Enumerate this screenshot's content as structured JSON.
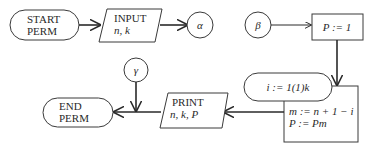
{
  "diagram": {
    "nodes": {
      "start": {
        "line1": "START",
        "line2": "PERM",
        "shape": "terminal"
      },
      "input": {
        "line1": "INPUT",
        "line2": "n, k",
        "shape": "parallelogram"
      },
      "alpha": {
        "label": "α",
        "shape": "connector"
      },
      "beta": {
        "label": "β",
        "shape": "connector"
      },
      "init": {
        "label": "P := 1",
        "shape": "process"
      },
      "loop": {
        "label": "i := 1(1)k",
        "shape": "loop-terminal"
      },
      "body": {
        "line1": "m := n + 1 − i",
        "line2": "P := Pm",
        "shape": "process"
      },
      "print": {
        "line1": "PRINT",
        "line2": "n, k, P",
        "shape": "parallelogram"
      },
      "gamma": {
        "label": "γ",
        "shape": "connector"
      },
      "end": {
        "line1": "END",
        "line2": "PERM",
        "shape": "terminal"
      }
    },
    "edges": [
      {
        "from": "start",
        "to": "input"
      },
      {
        "from": "input",
        "to": "alpha"
      },
      {
        "from": "beta",
        "to": "init"
      },
      {
        "from": "init",
        "to": "body"
      },
      {
        "from": "body",
        "to": "print"
      },
      {
        "from": "print",
        "to": "end"
      },
      {
        "from": "gamma",
        "to": "end-line"
      }
    ],
    "colors": {
      "stroke": "#2a2a2a",
      "background": "#ffffff"
    }
  }
}
